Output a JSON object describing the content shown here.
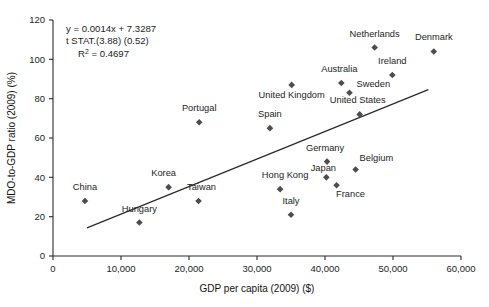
{
  "chart_data": {
    "type": "scatter",
    "title": "",
    "xlabel": "GDP per capita (2009) ($)",
    "ylabel": "MDO-to-GDP ratio (2009) (%)",
    "xlim": [
      0,
      60000
    ],
    "ylim": [
      0,
      120
    ],
    "xticks": [
      0,
      10000,
      20000,
      30000,
      40000,
      50000,
      60000
    ],
    "xticklabels": [
      "0",
      "10,000",
      "20,000",
      "30,000",
      "40,000",
      "50,000",
      "60,000"
    ],
    "yticks": [
      0,
      20,
      40,
      60,
      80,
      100,
      120
    ],
    "yticklabels": [
      "0",
      "20",
      "40",
      "60",
      "80",
      "100",
      "120"
    ],
    "grid": false,
    "legend": null,
    "marker_color": "#4d4d4d",
    "line_color": "#2b2b2b",
    "points": [
      {
        "label": "China",
        "x": 4700,
        "y": 28,
        "lx": 0,
        "ly": -11,
        "anchor": "middle"
      },
      {
        "label": "Hungary",
        "x": 12700,
        "y": 17,
        "lx": 0,
        "ly": -11,
        "anchor": "middle"
      },
      {
        "label": "Korea",
        "x": 17000,
        "y": 35,
        "lx": -5,
        "ly": -11,
        "anchor": "middle"
      },
      {
        "label": "Taiwan",
        "x": 21400,
        "y": 28,
        "lx": 3,
        "ly": -11,
        "anchor": "middle"
      },
      {
        "label": "Portugal",
        "x": 21500,
        "y": 68,
        "lx": 0,
        "ly": -11,
        "anchor": "middle"
      },
      {
        "label": "Spain",
        "x": 31900,
        "y": 65,
        "lx": 0,
        "ly": -11,
        "anchor": "middle"
      },
      {
        "label": "Hong Kong",
        "x": 33400,
        "y": 34,
        "lx": 5,
        "ly": -11,
        "anchor": "middle"
      },
      {
        "label": "Italy",
        "x": 35000,
        "y": 21,
        "lx": 0,
        "ly": -11,
        "anchor": "middle"
      },
      {
        "label": "United Kingdom",
        "x": 35100,
        "y": 87,
        "lx": 0,
        "ly": 13,
        "anchor": "middle"
      },
      {
        "label": "Germany",
        "x": 40300,
        "y": 48,
        "lx": -2,
        "ly": -11,
        "anchor": "middle"
      },
      {
        "label": "Japan",
        "x": 40200,
        "y": 40,
        "lx": -3,
        "ly": -6,
        "anchor": "middle"
      },
      {
        "label": "France",
        "x": 41700,
        "y": 36,
        "lx": 14,
        "ly": 12,
        "anchor": "middle"
      },
      {
        "label": "Australia",
        "x": 42400,
        "y": 88,
        "lx": -2,
        "ly": -11,
        "anchor": "middle"
      },
      {
        "label": "Belgium",
        "x": 44500,
        "y": 44,
        "lx": 4,
        "ly": -8,
        "anchor": "start"
      },
      {
        "label": "Sweden",
        "x": 43600,
        "y": 83,
        "lx": 7,
        "ly": -6,
        "anchor": "start"
      },
      {
        "label": "United States",
        "x": 45100,
        "y": 72,
        "lx": -2,
        "ly": -11,
        "anchor": "middle"
      },
      {
        "label": "Netherlands",
        "x": 47300,
        "y": 106,
        "lx": 0,
        "ly": -11,
        "anchor": "middle"
      },
      {
        "label": "Ireland",
        "x": 49900,
        "y": 92,
        "lx": 0,
        "ly": -11,
        "anchor": "middle"
      },
      {
        "label": "Denmark",
        "x": 56000,
        "y": 104,
        "lx": 0,
        "ly": -11,
        "anchor": "middle"
      }
    ],
    "trendline": {
      "slope": 0.0014,
      "intercept": 7.3287,
      "x_start": 5000,
      "x_end": 55200
    },
    "annotation": {
      "equation": "y = 0.0014x + 7.3287",
      "tstat": "t STAT.(3.88) (0.52)",
      "r2_prefix": "R",
      "r2_exp": "2",
      "r2_value": " = 0.4697"
    }
  }
}
